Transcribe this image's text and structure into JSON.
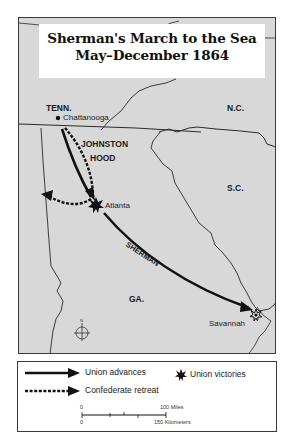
{
  "title": {
    "line1": "Sherman's March to the Sea",
    "line2": "May–December 1864"
  },
  "map": {
    "states": [
      {
        "abbr": "TENN."
      },
      {
        "abbr": "N.C."
      },
      {
        "abbr": "S.C."
      },
      {
        "abbr": "GA."
      }
    ],
    "cities": [
      {
        "name": "Chattanooga"
      },
      {
        "name": "Atlanta"
      },
      {
        "name": "Savannah"
      }
    ],
    "route_labels": {
      "johnston": "JOHNSTON",
      "hood": "HOOD",
      "sherman": "SHERMAN"
    },
    "compass": {
      "north_label": "N"
    },
    "colors": {
      "land": "#d8d8d8",
      "border": "#2a2a2a",
      "route": "#111111"
    }
  },
  "legend": {
    "union_advances": "Union advances",
    "confederate_retreat": "Confederate retreat",
    "union_victories": "Union victories",
    "scale": {
      "miles_start": "0",
      "miles_end": "100 Miles",
      "km_start": "0",
      "km_end": "150 Kilometers"
    }
  }
}
